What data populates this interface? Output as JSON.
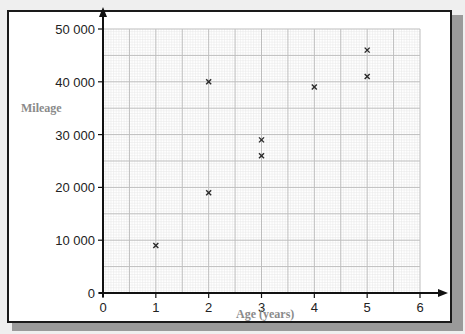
{
  "chart_data": {
    "type": "scatter",
    "title": "",
    "xlabel": "Age (years)",
    "ylabel": "Mileage",
    "xlim": [
      0,
      6
    ],
    "ylim": [
      0,
      50000
    ],
    "x_ticks": [
      0,
      1,
      2,
      3,
      4,
      5,
      6
    ],
    "x_tick_labels": [
      "0",
      "1",
      "2",
      "3",
      "4",
      "5",
      "6"
    ],
    "y_ticks": [
      0,
      10000,
      20000,
      30000,
      40000,
      50000
    ],
    "y_tick_labels": [
      "0",
      "10 000",
      "20 000",
      "30 000",
      "40 000",
      "50 000"
    ],
    "grid": true,
    "grid_major_x": 0.5,
    "grid_major_y": 5000,
    "grid_minor_divisions": 10,
    "marker": "x",
    "legend": "none",
    "series": [
      {
        "name": "Cars",
        "points": [
          {
            "x": 1,
            "y": 9000
          },
          {
            "x": 2,
            "y": 19000
          },
          {
            "x": 2,
            "y": 40000
          },
          {
            "x": 3,
            "y": 26000
          },
          {
            "x": 3,
            "y": 29000
          },
          {
            "x": 4,
            "y": 39000
          },
          {
            "x": 5,
            "y": 41000
          },
          {
            "x": 5,
            "y": 46000
          }
        ]
      }
    ],
    "colors": {
      "marker": "#2a2a2a",
      "axis": "#111111",
      "grid_major": "#bdbdbd",
      "grid_minor": "#e6e6e6",
      "axis_title": "#8a8a8a"
    }
  }
}
